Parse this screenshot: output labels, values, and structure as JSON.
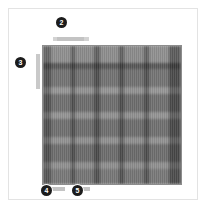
{
  "figure": {
    "background_color": "#ffffff",
    "card_border_color": "#e3e3e3",
    "plot_border_color": "#8d8d8d"
  },
  "annotations": {
    "marker_color": "#1c1c1c",
    "marker_text_color": "#ffffff",
    "items": [
      {
        "id": "title-marker",
        "number": "2",
        "points_to": "chart-title"
      },
      {
        "id": "ylabel-marker",
        "number": "3",
        "points_to": "y-axis-label"
      },
      {
        "id": "xaxis-marker",
        "number": "4",
        "points_to": "x-axis-label"
      },
      {
        "id": "xtick-marker",
        "number": "5",
        "points_to": "x-tick-label"
      }
    ]
  },
  "labels": {
    "title_placeholder": "",
    "y_axis_placeholder": "",
    "x_axis_placeholder": "",
    "x_tick_placeholder": ""
  },
  "chart_data": {
    "type": "heatmap",
    "title": "",
    "xlabel": "",
    "ylabel": "",
    "grid": false,
    "legend": "none",
    "colormap": "grays",
    "value_range": [
      0.3,
      0.78
    ],
    "note": "Blurred low-resolution grayscale heatmap; bands read as alternating light and dark rows and columns.",
    "x_band_edges_pct": [
      0,
      6,
      20,
      23,
      37,
      41,
      55,
      59,
      73,
      77,
      91,
      100
    ],
    "y_band_edges_pct": [
      0,
      12,
      17,
      30,
      35,
      48,
      53,
      66,
      71,
      84,
      89,
      100
    ],
    "columns": [
      {
        "x_start_pct": 0,
        "x_end_pct": 6,
        "value": 0.44
      },
      {
        "x_start_pct": 6,
        "x_end_pct": 20,
        "value": 0.7
      },
      {
        "x_start_pct": 20,
        "x_end_pct": 23,
        "value": 0.4
      },
      {
        "x_start_pct": 23,
        "x_end_pct": 37,
        "value": 0.68
      },
      {
        "x_start_pct": 37,
        "x_end_pct": 41,
        "value": 0.4
      },
      {
        "x_start_pct": 41,
        "x_end_pct": 55,
        "value": 0.69
      },
      {
        "x_start_pct": 55,
        "x_end_pct": 59,
        "value": 0.4
      },
      {
        "x_start_pct": 59,
        "x_end_pct": 73,
        "value": 0.68
      },
      {
        "x_start_pct": 73,
        "x_end_pct": 77,
        "value": 0.41
      },
      {
        "x_start_pct": 77,
        "x_end_pct": 91,
        "value": 0.7
      },
      {
        "x_start_pct": 91,
        "x_end_pct": 100,
        "value": 0.38
      }
    ],
    "rows": [
      {
        "y_start_pct": 0,
        "y_end_pct": 12,
        "value": 0.74
      },
      {
        "y_start_pct": 12,
        "y_end_pct": 17,
        "value": 0.46
      },
      {
        "y_start_pct": 17,
        "y_end_pct": 30,
        "value": 0.6
      },
      {
        "y_start_pct": 30,
        "y_end_pct": 35,
        "value": 0.78
      },
      {
        "y_start_pct": 35,
        "y_end_pct": 48,
        "value": 0.58
      },
      {
        "y_start_pct": 48,
        "y_end_pct": 53,
        "value": 0.77
      },
      {
        "y_start_pct": 53,
        "y_end_pct": 66,
        "value": 0.58
      },
      {
        "y_start_pct": 66,
        "y_end_pct": 71,
        "value": 0.76
      },
      {
        "y_start_pct": 71,
        "y_end_pct": 84,
        "value": 0.57
      },
      {
        "y_start_pct": 84,
        "y_end_pct": 89,
        "value": 0.75
      },
      {
        "y_start_pct": 89,
        "y_end_pct": 100,
        "value": 0.62
      }
    ]
  }
}
